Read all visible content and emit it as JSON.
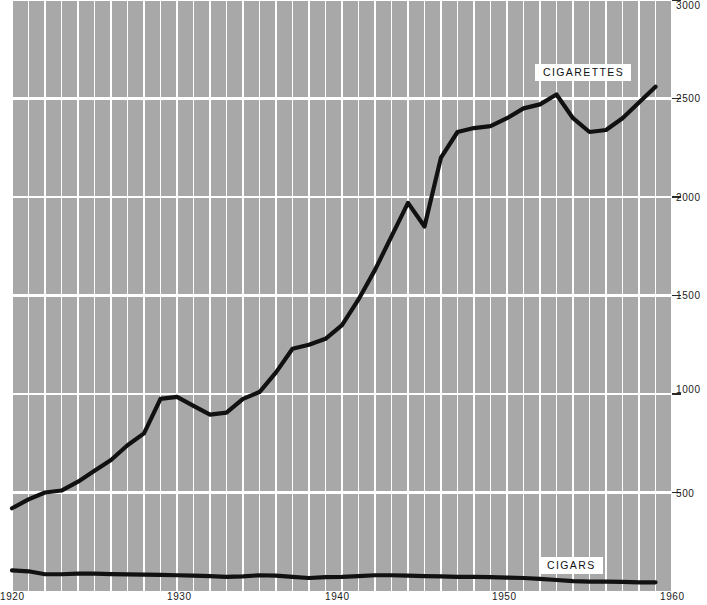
{
  "chart_data": {
    "type": "line",
    "title": "",
    "subtitle": "",
    "xlabel": "",
    "ylabel": "",
    "xlim": [
      1920,
      1960
    ],
    "ylim": [
      0,
      3000
    ],
    "grid": true,
    "grid_x_step": 1,
    "grid_y_step": 500,
    "background": "#a8a8a8",
    "gridline_color": "#ffffff",
    "line_color": "#111111",
    "legend_position": "inline-labels",
    "xticks": [
      1920,
      1930,
      1940,
      1950,
      1960
    ],
    "xtick_labels": [
      "1920",
      "1930",
      "1940",
      "1950",
      "1960"
    ],
    "yticks": [
      500,
      1000,
      1500,
      2000,
      2500,
      3000
    ],
    "ytick_labels": [
      "500",
      "1000",
      "1500",
      "2000",
      "2500",
      "3000"
    ],
    "series": [
      {
        "name": "CIGARETTES",
        "label": "CIGARETTES",
        "color": "#111111",
        "x": [
          1920,
          1921,
          1922,
          1923,
          1924,
          1925,
          1926,
          1927,
          1928,
          1929,
          1930,
          1931,
          1932,
          1933,
          1934,
          1935,
          1936,
          1937,
          1938,
          1939,
          1940,
          1941,
          1942,
          1943,
          1944,
          1945,
          1946,
          1947,
          1948,
          1949,
          1950,
          1951,
          1952,
          1953,
          1954,
          1955,
          1956,
          1957,
          1958,
          1959
        ],
        "values": [
          420,
          465,
          500,
          510,
          555,
          610,
          665,
          740,
          800,
          975,
          985,
          940,
          895,
          905,
          975,
          1010,
          1110,
          1230,
          1250,
          1280,
          1350,
          1480,
          1630,
          1800,
          1970,
          1850,
          2200,
          2330,
          2350,
          2360,
          2400,
          2450,
          2470,
          2520,
          2400,
          2330,
          2340,
          2400,
          2480,
          2560
        ]
      },
      {
        "name": "CIGARS",
        "label": "CIGARS",
        "color": "#111111",
        "x": [
          1920,
          1921,
          1922,
          1923,
          1924,
          1925,
          1926,
          1927,
          1928,
          1929,
          1930,
          1931,
          1932,
          1933,
          1934,
          1935,
          1936,
          1937,
          1938,
          1939,
          1940,
          1941,
          1942,
          1943,
          1944,
          1945,
          1946,
          1947,
          1948,
          1949,
          1950,
          1951,
          1952,
          1953,
          1954,
          1955,
          1956,
          1957,
          1958,
          1959
        ],
        "values": [
          105,
          100,
          85,
          85,
          88,
          88,
          86,
          84,
          83,
          82,
          80,
          78,
          76,
          72,
          74,
          80,
          78,
          72,
          66,
          70,
          72,
          76,
          80,
          80,
          78,
          76,
          74,
          72,
          72,
          70,
          68,
          66,
          62,
          56,
          50,
          48,
          48,
          46,
          44,
          44
        ]
      }
    ],
    "annotations": [
      {
        "text": "CIGARETTES",
        "x": 1954,
        "y": 2720
      },
      {
        "text": "CIGARS",
        "x": 1954,
        "y": 240
      }
    ]
  },
  "labels": {
    "cigarettes": "CIGARETTES",
    "cigars": "CIGARS"
  }
}
